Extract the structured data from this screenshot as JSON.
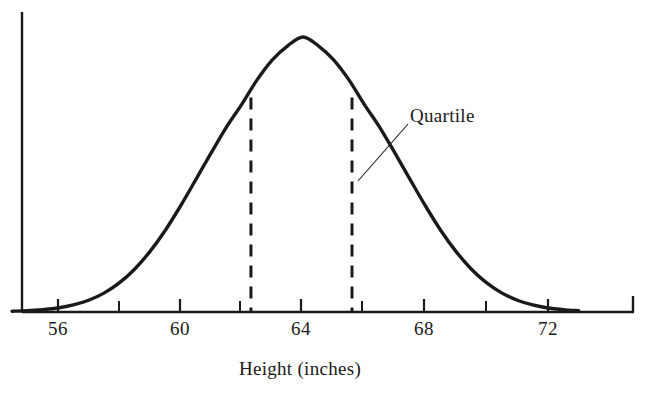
{
  "chart_data": {
    "type": "line",
    "title": "",
    "subtitle": "",
    "xlabel": "Height (inches)",
    "ylabel": "",
    "xlim": [
      54.5,
      73.0
    ],
    "ylim": [
      0,
      1.05
    ],
    "grid": false,
    "legend": null,
    "x_ticks_major": [
      56,
      60,
      64,
      68,
      72
    ],
    "x_tick_labels": [
      "56",
      "60",
      "64",
      "68",
      "72"
    ],
    "x_ticks_minor": [
      58,
      62,
      66,
      70
    ],
    "distribution": {
      "shape": "normal",
      "mean": 64.0,
      "std_dev": 2.45,
      "peak_value": 1.0
    },
    "markers": [
      {
        "name": "lower-quartile",
        "x": 62.3,
        "y_top": 0.78,
        "style": "dashed-vertical"
      },
      {
        "name": "upper-quartile",
        "x": 65.6,
        "y_top": 0.78,
        "style": "dashed-vertical"
      }
    ],
    "annotations": [
      {
        "text": "Quartile",
        "target_x": 65.6,
        "target_y": 0.42,
        "label_x": 67.3,
        "label_y": 0.71
      }
    ],
    "series": [
      {
        "name": "height-distribution",
        "x": [
          54.5,
          55.0,
          55.5,
          56.0,
          56.5,
          57.0,
          57.5,
          58.0,
          58.5,
          59.0,
          59.5,
          60.0,
          60.5,
          61.0,
          61.5,
          62.0,
          62.5,
          63.0,
          63.5,
          64.0,
          64.5,
          65.0,
          65.5,
          66.0,
          66.5,
          67.0,
          67.5,
          68.0,
          68.5,
          69.0,
          69.5,
          70.0,
          70.5,
          71.0,
          71.5,
          72.0,
          72.5,
          73.0
        ],
        "values": [
          0.002,
          0.004,
          0.008,
          0.014,
          0.025,
          0.042,
          0.068,
          0.105,
          0.155,
          0.219,
          0.296,
          0.385,
          0.481,
          0.578,
          0.672,
          0.755,
          0.844,
          0.917,
          0.968,
          1.0,
          0.968,
          0.917,
          0.844,
          0.755,
          0.672,
          0.578,
          0.481,
          0.385,
          0.296,
          0.219,
          0.155,
          0.105,
          0.068,
          0.042,
          0.025,
          0.014,
          0.008,
          0.004
        ]
      }
    ]
  },
  "axes": {
    "x_label": "Height (inches)",
    "tick_labels": [
      {
        "text": "56",
        "x_value": 56
      },
      {
        "text": "60",
        "x_value": 60
      },
      {
        "text": "64",
        "x_value": 64
      },
      {
        "text": "68",
        "x_value": 68
      },
      {
        "text": "72",
        "x_value": 72
      }
    ]
  },
  "annotation": {
    "quartile_label": "Quartile"
  },
  "colors": {
    "curve": "#1a1a1a",
    "axis": "#1a1a1a",
    "dashed": "#1a1a1a",
    "text": "#1a1a1a",
    "background": "#ffffff"
  }
}
